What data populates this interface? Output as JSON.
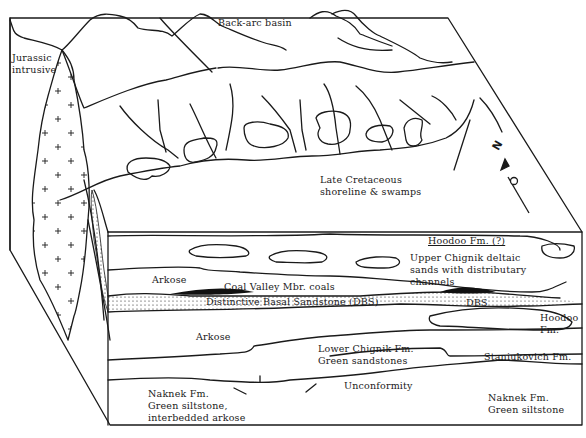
{
  "diagram": {
    "title": "",
    "style": "block diagram, black line art",
    "colors": {
      "line": "#1a1a1a",
      "background": "#ffffff",
      "coal": "#111111"
    },
    "labels": {
      "back_arc_basin": "Back-arc basin",
      "jurassic_intrusive": "Jurassic\nintrusive",
      "late_cretaceous": "Late Cretaceous\nshoreline & swamps",
      "north_arrow": "N",
      "hoodoo_top": "Hoodoo Fm. (?)",
      "upper_chignik": "Upper Chignik deltaic\nsands with distributary\nchannels",
      "arkose_upper": "Arkose",
      "coal_valley": "Coal Valley Mbr. coals",
      "dbs_full": "Distinctive Basal Sandstone (DBS)",
      "dbs_short": "DBS",
      "hoodoo_right": "Hoodoo\nFm.",
      "arkose_lower": "Arkose",
      "lower_chignik": "Lower Chignik Fm.\nGreen sandstones",
      "staniukovich": "Staniukovich Fm.",
      "unconformity": "Unconformity",
      "naknek_left": "Naknek Fm.\nGreen siltstone,\ninterbedded arkose",
      "naknek_right": "Naknek Fm.\nGreen siltstone"
    }
  }
}
